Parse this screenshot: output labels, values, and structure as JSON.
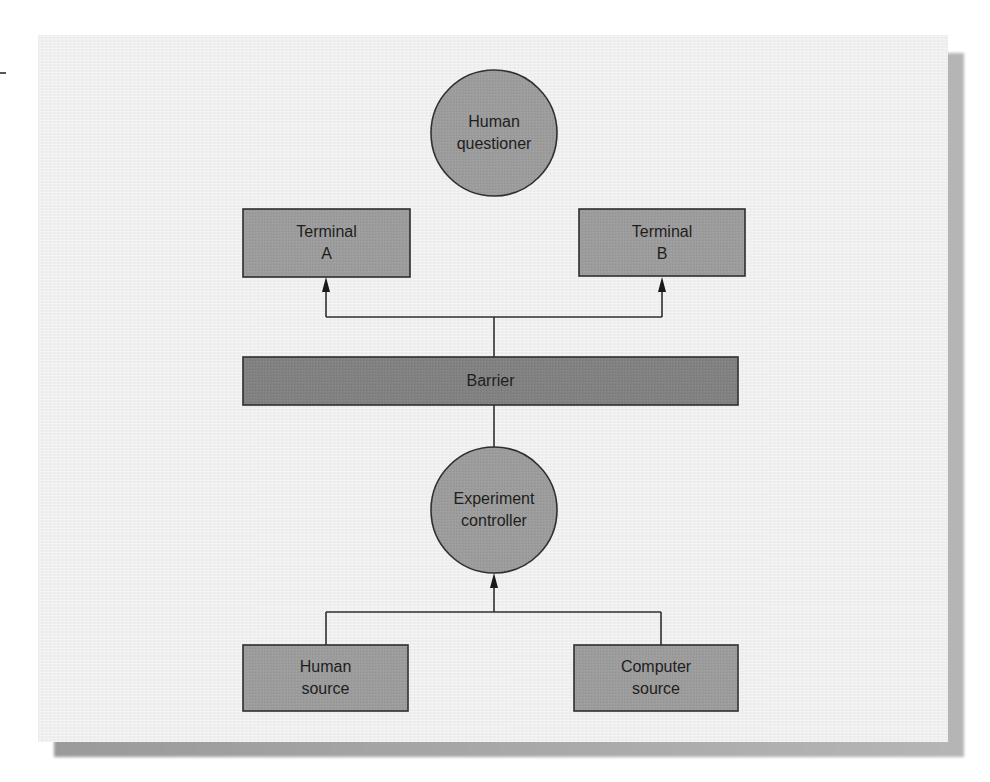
{
  "diagram": {
    "nodes": {
      "human_questioner": {
        "label": "Human\nquestioner",
        "shape": "circle"
      },
      "terminal_a": {
        "label": "Terminal\nA",
        "shape": "rect"
      },
      "terminal_b": {
        "label": "Terminal\nB",
        "shape": "rect"
      },
      "barrier": {
        "label": "Barrier",
        "shape": "rect"
      },
      "experiment_controller": {
        "label": "Experiment\ncontroller",
        "shape": "circle"
      },
      "human_source": {
        "label": "Human\nsource",
        "shape": "rect"
      },
      "computer_source": {
        "label": "Computer\nsource",
        "shape": "rect"
      }
    },
    "edges": [
      {
        "from": "barrier",
        "to": "terminal_a",
        "arrow": true
      },
      {
        "from": "barrier",
        "to": "terminal_b",
        "arrow": true
      },
      {
        "from": "experiment_controller",
        "to": "barrier",
        "arrow": false
      },
      {
        "from": "human_source",
        "to": "experiment_controller",
        "arrow": true
      },
      {
        "from": "computer_source",
        "to": "experiment_controller",
        "arrow": true
      }
    ],
    "colors": {
      "panel_bg": "#efefef",
      "node_fill": "#9c9c9c",
      "barrier_fill": "#818181",
      "stroke": "#2f2f2f",
      "text": "#1e1e1e"
    }
  }
}
